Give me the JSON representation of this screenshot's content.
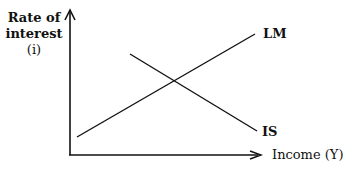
{
  "diagram": {
    "y_axis_label_lines": [
      "Rate of",
      "interest",
      "(i)"
    ],
    "x_axis_label": "Income (Y)",
    "curves": [
      {
        "name": "LM",
        "label": "LM",
        "slope": "upward"
      },
      {
        "name": "IS",
        "label": "IS",
        "slope": "downward"
      }
    ],
    "colors": {
      "line": "#111111",
      "background": "#ffffff"
    }
  }
}
